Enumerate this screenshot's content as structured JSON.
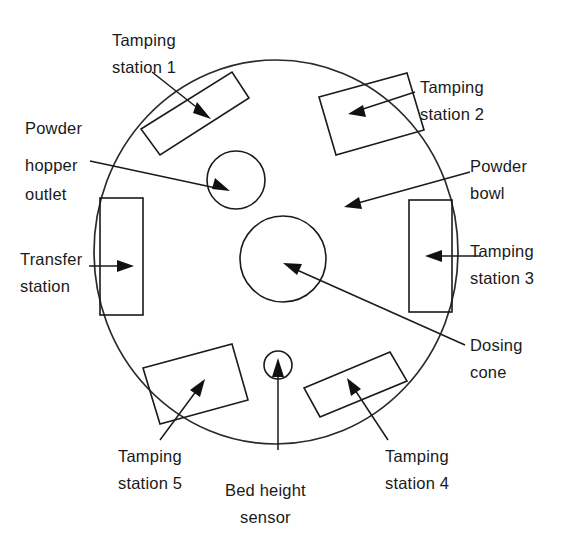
{
  "diagram": {
    "background_color": "#ffffff",
    "line_color": "#1a1a1a",
    "turret": {
      "name": "outer-turret-disc",
      "center_x": 276,
      "center_y": 252,
      "radius_x": 182,
      "radius_y": 192
    },
    "labels": {
      "tamping_station_1": {
        "line1": "Tamping",
        "line2": "station 1"
      },
      "tamping_station_2": {
        "line1": "Tamping",
        "line2": "station 2"
      },
      "tamping_station_3": {
        "line1": "Tamping",
        "line2": "station 3"
      },
      "tamping_station_4": {
        "line1": "Tamping",
        "line2": "station 4"
      },
      "tamping_station_5": {
        "line1": "Tamping",
        "line2": "station 5"
      },
      "powder_hopper_outlet": {
        "line1": "Powder",
        "line2": "hopper",
        "line3": "outlet"
      },
      "powder_bowl": {
        "line1": "Powder",
        "line2": "bowl"
      },
      "transfer_station": {
        "line1": "Transfer",
        "line2": "station"
      },
      "dosing_cone": {
        "line1": "Dosing",
        "line2": "cone"
      },
      "bed_height_sensor": {
        "line1": "Bed height",
        "line2": "sensor"
      }
    },
    "components": [
      {
        "name": "tamping-station-1-block",
        "kind": "rectangle",
        "rotation_deg": -32
      },
      {
        "name": "tamping-station-2-block",
        "kind": "rectangle",
        "rotation_deg": 32
      },
      {
        "name": "tamping-station-3-block",
        "kind": "rectangle",
        "rotation_deg": 0
      },
      {
        "name": "tamping-station-4-block",
        "kind": "rectangle",
        "rotation_deg": -20
      },
      {
        "name": "tamping-station-5-block",
        "kind": "rectangle",
        "rotation_deg": 20
      },
      {
        "name": "transfer-station-block",
        "kind": "rectangle",
        "rotation_deg": 0
      },
      {
        "name": "powder-hopper-outlet-circle",
        "kind": "circle",
        "radius": 29
      },
      {
        "name": "dosing-cone-circle",
        "kind": "circle",
        "radius": 43
      },
      {
        "name": "bed-height-sensor-circle",
        "kind": "circle",
        "radius": 14
      }
    ]
  }
}
